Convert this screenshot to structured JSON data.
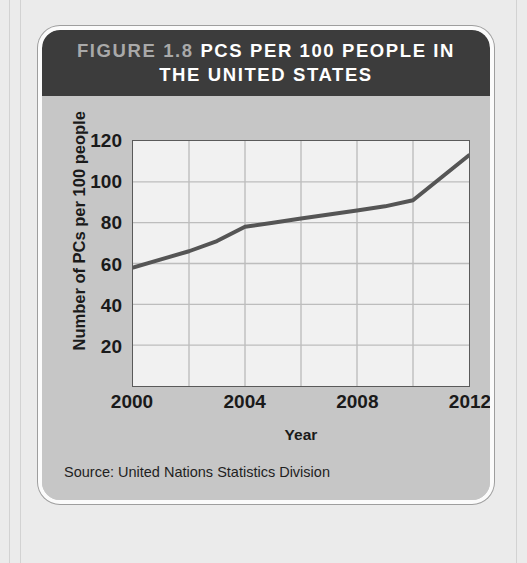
{
  "figure": {
    "number_label": "FIGURE 1.8",
    "title_main": "PCs PER 100 PEOPLE IN THE UNITED STATES",
    "title_line1": "FIGURE 1.8 PCs PER 100 PEOPLE IN",
    "title_line2": "THE UNITED STATES",
    "source": "Source: United Nations Statistics Division"
  },
  "colors": {
    "header_background": "#3c3c3c",
    "figure_number_text": "#a9a9a9",
    "title_text": "#ffffff",
    "card_background": "#c6c6c6",
    "plot_background": "#f1f1f1",
    "gridline": "#bdbdbd",
    "axis_line": "#5a5a5a",
    "series_line": "#555555"
  },
  "chart_data": {
    "type": "line",
    "title": "PCs per 100 people in the United States",
    "xlabel": "Year",
    "ylabel": "Number of PCs per 100 people",
    "xlim": [
      2000,
      2012
    ],
    "ylim": [
      0,
      120
    ],
    "xticks": [
      2000,
      2004,
      2008,
      2012
    ],
    "yticks": [
      20,
      40,
      60,
      80,
      100,
      120
    ],
    "gridlines_x": [
      2000,
      2002,
      2004,
      2006,
      2008,
      2010,
      2012
    ],
    "gridlines_y": [
      20,
      40,
      60,
      80,
      100,
      120
    ],
    "grid": true,
    "legend": "none",
    "x": [
      2000,
      2001,
      2002,
      2003,
      2004,
      2005,
      2006,
      2007,
      2008,
      2009,
      2010,
      2011,
      2012
    ],
    "values": [
      58,
      62,
      66,
      71,
      78,
      80,
      82,
      84,
      86,
      88,
      91,
      102,
      113
    ],
    "series": [
      {
        "name": "PCs per 100 people",
        "values": [
          58,
          62,
          66,
          71,
          78,
          80,
          82,
          84,
          86,
          88,
          91,
          102,
          113
        ]
      }
    ],
    "source": "United Nations Statistics Division"
  }
}
